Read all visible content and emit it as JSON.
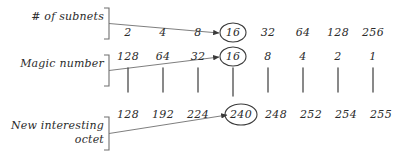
{
  "diagram": {
    "background_color": "#ffffff",
    "ink_color": "#3a3a3a",
    "text_color": "#2b2b2b"
  },
  "labels": {
    "subnets": "# of subnets",
    "magic_number": "Magic number",
    "new_octet": "New interesting\noctet"
  },
  "rows": [
    {
      "name": "subnets",
      "label": "# of subnets",
      "values": [
        "2",
        "4",
        "8",
        "16",
        "32",
        "64",
        "128",
        "256"
      ],
      "highlighted_index": 3,
      "highlighted_value": "16"
    },
    {
      "name": "magic-number",
      "label": "Magic number",
      "values": [
        "128",
        "64",
        "32",
        "16",
        "8",
        "4",
        "2",
        "1"
      ],
      "highlighted_index": 3,
      "highlighted_value": "16"
    },
    {
      "name": "new-interesting-octet",
      "label": "New interesting octet",
      "values": [
        "128",
        "192",
        "224",
        "240",
        "248",
        "252",
        "254",
        "255"
      ],
      "highlighted_index": 3,
      "highlighted_value": "240"
    }
  ],
  "annotations": {
    "circled_values": [
      "16",
      "16",
      "240"
    ],
    "arrow_count": 3,
    "tick_count": 8
  }
}
